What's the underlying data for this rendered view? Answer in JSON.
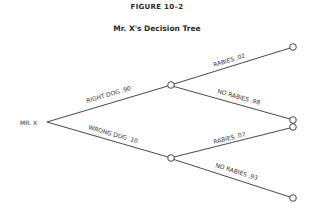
{
  "figure": {
    "label": "FIGURE 10–2",
    "title": "Mr. X's Decision Tree"
  },
  "tree": {
    "root": {
      "label": "MR. X"
    },
    "branches": [
      {
        "label": "RIGHT DOG .90",
        "outcomes": [
          {
            "label": "RABIES .02"
          },
          {
            "label": "NO RABIES .98"
          }
        ]
      },
      {
        "label": "WRONG DOG .10",
        "outcomes": [
          {
            "label": "RABIES .07"
          },
          {
            "label": "NO RABIES .93"
          }
        ]
      }
    ]
  },
  "colors": {
    "line": "#333333",
    "background": "#ffffff"
  }
}
